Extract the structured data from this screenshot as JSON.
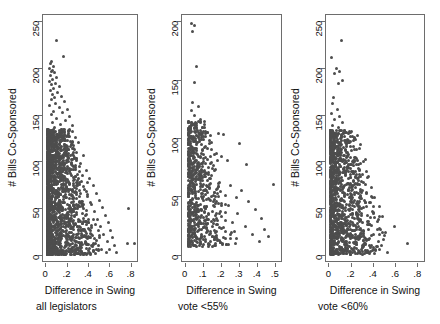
{
  "figure": {
    "type": "scatter-panel-figure",
    "background": "#ffffff",
    "point_color": "#4d4d4d",
    "axis_color": "#6d6d6d"
  },
  "chart_data": [
    {
      "type": "scatter",
      "title": "",
      "xlabel": "Difference in Swing",
      "sublabel": "all legislators",
      "ylabel": "# Bills Co-Sponsored",
      "xlim": [
        -0.03,
        0.87
      ],
      "ylim": [
        -8,
        258
      ],
      "xticks": [
        0,
        0.2,
        0.4,
        0.6,
        0.8
      ],
      "xticklabels": [
        "0",
        ".2",
        ".4",
        ".6",
        ".8"
      ],
      "yticks": [
        0,
        50,
        100,
        150,
        200,
        250
      ],
      "yticklabels": [
        "0",
        "50",
        "100",
        "150",
        "200",
        "250"
      ],
      "grid": false,
      "legend": "none",
      "n_points": 1700,
      "description": "Dense wedge-shaped cloud concentrated near x=0 to 0.3, tapering down and right; a few far outliers near x=.77 and x=.83",
      "points": [
        [
          0.1,
          231
        ],
        [
          0.16,
          213
        ],
        [
          0.05,
          208
        ],
        [
          0.04,
          206
        ],
        [
          0.07,
          203
        ],
        [
          0.03,
          201
        ],
        [
          0.06,
          199
        ],
        [
          0.05,
          197
        ],
        [
          0.08,
          196
        ],
        [
          0.04,
          193
        ],
        [
          0.1,
          191
        ],
        [
          0.06,
          189
        ],
        [
          0.03,
          187
        ],
        [
          0.09,
          185
        ],
        [
          0.05,
          183
        ],
        [
          0.12,
          181
        ],
        [
          0.07,
          179
        ],
        [
          0.04,
          177
        ],
        [
          0.11,
          175
        ],
        [
          0.06,
          173
        ],
        [
          0.14,
          171
        ],
        [
          0.08,
          169
        ],
        [
          0.05,
          167
        ],
        [
          0.17,
          165
        ],
        [
          0.09,
          163
        ],
        [
          0.03,
          161
        ],
        [
          0.12,
          159
        ],
        [
          0.2,
          157
        ],
        [
          0.07,
          155
        ],
        [
          0.15,
          153
        ],
        [
          0.05,
          151
        ],
        [
          0.22,
          149
        ],
        [
          0.1,
          147
        ],
        [
          0.18,
          145
        ],
        [
          0.06,
          143
        ],
        [
          0.13,
          141
        ],
        [
          0.25,
          139
        ],
        [
          0.08,
          137
        ],
        [
          0.16,
          135
        ],
        [
          0.04,
          133
        ],
        [
          0.21,
          131
        ],
        [
          0.11,
          129
        ],
        [
          0.27,
          127
        ],
        [
          0.07,
          125
        ],
        [
          0.17,
          123
        ],
        [
          0.3,
          121
        ],
        [
          0.09,
          119
        ],
        [
          0.23,
          117
        ],
        [
          0.13,
          115
        ],
        [
          0.05,
          113
        ],
        [
          0.28,
          111
        ],
        [
          0.19,
          109
        ],
        [
          0.35,
          107
        ],
        [
          0.1,
          105
        ],
        [
          0.24,
          103
        ],
        [
          0.15,
          101
        ],
        [
          0.32,
          99
        ],
        [
          0.07,
          97
        ],
        [
          0.26,
          95
        ],
        [
          0.2,
          93
        ],
        [
          0.38,
          91
        ],
        [
          0.12,
          89
        ],
        [
          0.29,
          87
        ],
        [
          0.17,
          85
        ],
        [
          0.41,
          83
        ],
        [
          0.08,
          81
        ],
        [
          0.33,
          79
        ],
        [
          0.22,
          77
        ],
        [
          0.44,
          75
        ],
        [
          0.14,
          73
        ],
        [
          0.36,
          71
        ],
        [
          0.25,
          69
        ],
        [
          0.47,
          67
        ],
        [
          0.09,
          65
        ],
        [
          0.39,
          63
        ],
        [
          0.28,
          61
        ],
        [
          0.5,
          59
        ],
        [
          0.16,
          57
        ],
        [
          0.42,
          55
        ],
        [
          0.31,
          53
        ],
        [
          0.53,
          51
        ],
        [
          0.77,
          50
        ],
        [
          0.11,
          49
        ],
        [
          0.45,
          47
        ],
        [
          0.34,
          45
        ],
        [
          0.56,
          43
        ],
        [
          0.19,
          41
        ],
        [
          0.48,
          39
        ],
        [
          0.37,
          37
        ],
        [
          0.58,
          35
        ],
        [
          0.13,
          33
        ],
        [
          0.51,
          31
        ],
        [
          0.4,
          29
        ],
        [
          0.6,
          27
        ],
        [
          0.22,
          25
        ],
        [
          0.54,
          23
        ],
        [
          0.43,
          21
        ],
        [
          0.62,
          19
        ],
        [
          0.83,
          13
        ],
        [
          0.76,
          13
        ],
        [
          0.57,
          15
        ],
        [
          0.46,
          13
        ],
        [
          0.64,
          11
        ],
        [
          0.25,
          9
        ],
        [
          0.59,
          7
        ],
        [
          0.49,
          5
        ],
        [
          0.66,
          3
        ],
        [
          0.3,
          2
        ]
      ]
    },
    {
      "type": "scatter",
      "title": "",
      "xlabel": "Difference in Swing",
      "sublabel": "vote <55%",
      "ylabel": "# Bills Co-Sponsored",
      "xlim": [
        -0.02,
        0.54
      ],
      "ylim": [
        -6,
        206
      ],
      "xticks": [
        0,
        0.1,
        0.2,
        0.3,
        0.4,
        0.5
      ],
      "xticklabels": [
        "0",
        ".1",
        ".2",
        ".3",
        ".4",
        ".5"
      ],
      "yticks": [
        0,
        50,
        100,
        150,
        200
      ],
      "yticklabels": [
        "0",
        "50",
        "100",
        "150",
        "200"
      ],
      "grid": false,
      "legend": "none",
      "n_points": 620,
      "description": "Sparser cloud, dense column near x=0.02-0.08 between y=10 and y=70, scattered points out to x=0.5",
      "points": [
        [
          0.03,
          199
        ],
        [
          0.05,
          197
        ],
        [
          0.04,
          192
        ],
        [
          0.06,
          162
        ],
        [
          0.05,
          148
        ],
        [
          0.04,
          131
        ],
        [
          0.07,
          128
        ],
        [
          0.03,
          124
        ],
        [
          0.05,
          120
        ],
        [
          0.08,
          117
        ],
        [
          0.04,
          113
        ],
        [
          0.06,
          110
        ],
        [
          0.18,
          105
        ],
        [
          0.21,
          104
        ],
        [
          0.03,
          102
        ],
        [
          0.07,
          101
        ],
        [
          0.1,
          100
        ],
        [
          0.05,
          98
        ],
        [
          0.3,
          96
        ],
        [
          0.09,
          95
        ],
        [
          0.04,
          93
        ],
        [
          0.12,
          92
        ],
        [
          0.06,
          90
        ],
        [
          0.17,
          88
        ],
        [
          0.03,
          86
        ],
        [
          0.2,
          85
        ],
        [
          0.08,
          84
        ],
        [
          0.23,
          82
        ],
        [
          0.05,
          80
        ],
        [
          0.11,
          79
        ],
        [
          0.34,
          78
        ],
        [
          0.07,
          76
        ],
        [
          0.15,
          75
        ],
        [
          0.04,
          73
        ],
        [
          0.09,
          71
        ],
        [
          0.49,
          61
        ],
        [
          0.06,
          68
        ],
        [
          0.13,
          66
        ],
        [
          0.03,
          64
        ],
        [
          0.19,
          63
        ],
        [
          0.08,
          62
        ],
        [
          0.25,
          60
        ],
        [
          0.05,
          58
        ],
        [
          0.11,
          57
        ],
        [
          0.31,
          56
        ],
        [
          0.07,
          55
        ],
        [
          0.16,
          54
        ],
        [
          0.04,
          53
        ],
        [
          0.22,
          52
        ],
        [
          0.09,
          51
        ],
        [
          0.28,
          50
        ],
        [
          0.06,
          49
        ],
        [
          0.13,
          48
        ],
        [
          0.35,
          47
        ],
        [
          0.03,
          46
        ],
        [
          0.18,
          45
        ],
        [
          0.08,
          44
        ],
        [
          0.24,
          43
        ],
        [
          0.05,
          42
        ],
        [
          0.11,
          41
        ],
        [
          0.39,
          40
        ],
        [
          0.07,
          39
        ],
        [
          0.15,
          38
        ],
        [
          0.04,
          37
        ],
        [
          0.29,
          36
        ],
        [
          0.09,
          35
        ],
        [
          0.2,
          34
        ],
        [
          0.06,
          33
        ],
        [
          0.42,
          32
        ],
        [
          0.12,
          31
        ],
        [
          0.03,
          30
        ],
        [
          0.26,
          29
        ],
        [
          0.08,
          28
        ],
        [
          0.17,
          27
        ],
        [
          0.05,
          26
        ],
        [
          0.33,
          25
        ],
        [
          0.1,
          24
        ],
        [
          0.44,
          23
        ],
        [
          0.07,
          22
        ],
        [
          0.22,
          21
        ],
        [
          0.04,
          20
        ],
        [
          0.14,
          19
        ],
        [
          0.37,
          18
        ],
        [
          0.09,
          17
        ],
        [
          0.46,
          17
        ],
        [
          0.06,
          16
        ],
        [
          0.28,
          15
        ],
        [
          0.11,
          14
        ],
        [
          0.19,
          13
        ],
        [
          0.03,
          12
        ],
        [
          0.41,
          12
        ],
        [
          0.08,
          11
        ],
        [
          0.24,
          10
        ],
        [
          0.05,
          9
        ],
        [
          0.15,
          8
        ]
      ]
    },
    {
      "type": "scatter",
      "title": "",
      "xlabel": "Difference in Swing",
      "sublabel": "vote <60%",
      "ylabel": "# Bills Co-Sponsored",
      "xlim": [
        -0.03,
        0.87
      ],
      "ylim": [
        -8,
        258
      ],
      "xticks": [
        0,
        0.2,
        0.4,
        0.6,
        0.8
      ],
      "xticklabels": [
        "0",
        ".2",
        ".4",
        ".6",
        ".8"
      ],
      "yticks": [
        0,
        50,
        100,
        150,
        200,
        250
      ],
      "yticklabels": [
        "0",
        "50",
        "100",
        "150",
        "200",
        "250"
      ],
      "grid": false,
      "legend": "none",
      "n_points": 1100,
      "description": "Dense column near x=0.02-0.25 tapering to the right; outliers at x=.70 y=13 and x=.59 y=31",
      "points": [
        [
          0.11,
          231
        ],
        [
          0.02,
          212
        ],
        [
          0.06,
          201
        ],
        [
          0.09,
          197
        ],
        [
          0.05,
          195
        ],
        [
          0.12,
          188
        ],
        [
          0.08,
          185
        ],
        [
          0.04,
          170
        ],
        [
          0.03,
          163
        ],
        [
          0.07,
          157
        ],
        [
          0.02,
          152
        ],
        [
          0.09,
          149
        ],
        [
          0.05,
          146
        ],
        [
          0.12,
          143
        ],
        [
          0.03,
          140
        ],
        [
          0.08,
          137
        ],
        [
          0.14,
          134
        ],
        [
          0.06,
          131
        ],
        [
          0.04,
          128
        ],
        [
          0.1,
          126
        ],
        [
          0.17,
          123
        ],
        [
          0.07,
          121
        ],
        [
          0.03,
          118
        ],
        [
          0.13,
          116
        ],
        [
          0.2,
          113
        ],
        [
          0.09,
          111
        ],
        [
          0.05,
          109
        ],
        [
          0.16,
          107
        ],
        [
          0.24,
          104
        ],
        [
          0.11,
          102
        ],
        [
          0.07,
          100
        ],
        [
          0.31,
          101
        ],
        [
          0.19,
          98
        ],
        [
          0.04,
          96
        ],
        [
          0.14,
          94
        ],
        [
          0.27,
          92
        ],
        [
          0.09,
          90
        ],
        [
          0.22,
          88
        ],
        [
          0.06,
          86
        ],
        [
          0.35,
          85
        ],
        [
          0.17,
          83
        ],
        [
          0.11,
          81
        ],
        [
          0.29,
          79
        ],
        [
          0.03,
          77
        ],
        [
          0.25,
          76
        ],
        [
          0.13,
          74
        ],
        [
          0.38,
          73
        ],
        [
          0.08,
          72
        ],
        [
          0.2,
          70
        ],
        [
          0.33,
          68
        ],
        [
          0.05,
          66
        ],
        [
          0.16,
          65
        ],
        [
          0.28,
          63
        ],
        [
          0.41,
          62
        ],
        [
          0.1,
          60
        ],
        [
          0.23,
          59
        ],
        [
          0.36,
          57
        ],
        [
          0.07,
          56
        ],
        [
          0.18,
          54
        ],
        [
          0.45,
          53
        ],
        [
          0.31,
          52
        ],
        [
          0.13,
          50
        ],
        [
          0.26,
          49
        ],
        [
          0.04,
          48
        ],
        [
          0.39,
          47
        ],
        [
          0.21,
          45
        ],
        [
          0.09,
          44
        ],
        [
          0.34,
          43
        ],
        [
          0.48,
          42
        ],
        [
          0.15,
          41
        ],
        [
          0.28,
          39
        ],
        [
          0.06,
          38
        ],
        [
          0.43,
          37
        ],
        [
          0.19,
          36
        ],
        [
          0.11,
          34
        ],
        [
          0.36,
          33
        ],
        [
          0.59,
          31
        ],
        [
          0.24,
          30
        ],
        [
          0.03,
          29
        ],
        [
          0.46,
          28
        ],
        [
          0.31,
          27
        ],
        [
          0.14,
          25
        ],
        [
          0.08,
          24
        ],
        [
          0.4,
          23
        ],
        [
          0.21,
          22
        ],
        [
          0.5,
          21
        ],
        [
          0.05,
          20
        ],
        [
          0.27,
          19
        ],
        [
          0.35,
          17
        ],
        [
          0.12,
          16
        ],
        [
          0.44,
          15
        ],
        [
          0.18,
          14
        ],
        [
          0.7,
          13
        ],
        [
          0.07,
          12
        ],
        [
          0.3,
          11
        ],
        [
          0.23,
          9
        ],
        [
          0.4,
          7
        ],
        [
          0.1,
          6
        ],
        [
          0.15,
          4
        ],
        [
          0.33,
          3
        ],
        [
          0.04,
          2
        ]
      ]
    }
  ]
}
